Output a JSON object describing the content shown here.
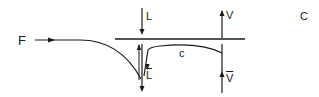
{
  "diagram": {
    "labels": {
      "feed": "F",
      "liquid_in": "L",
      "liquid_out": "L",
      "vapor_out": "V",
      "vapor_in": "V",
      "curve": "c",
      "corner": "C"
    },
    "colors": {
      "stroke": "#1a1a1a",
      "background": "#ffffff"
    }
  }
}
